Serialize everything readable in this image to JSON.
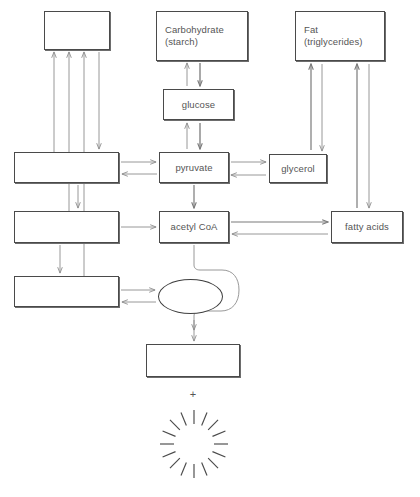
{
  "diagram": {
    "canvas": {
      "width": 420,
      "height": 497
    },
    "style": {
      "background": "#ffffff",
      "box_border_color": "#4a4a4a",
      "arrow_color": "#8d8d8d",
      "text_color": "#555555",
      "burst_color": "#4a4a4a"
    },
    "nodes": [
      {
        "id": "top-left-blank",
        "label": "",
        "label2": "",
        "shape": "rect",
        "align": "center",
        "x": 44,
        "y": 11,
        "w": 66,
        "h": 39
      },
      {
        "id": "carbohydrate",
        "label": "Carbohydrate",
        "label2": "(starch)",
        "shape": "rect",
        "align": "left",
        "x": 156,
        "y": 11,
        "w": 92,
        "h": 50
      },
      {
        "id": "fat",
        "label": "Fat",
        "label2": "(triglycerides)",
        "shape": "rect",
        "align": "left",
        "x": 295,
        "y": 11,
        "w": 90,
        "h": 50
      },
      {
        "id": "glucose",
        "label": "glucose",
        "label2": "",
        "shape": "rect",
        "align": "center",
        "x": 163,
        "y": 89,
        "w": 71,
        "h": 31
      },
      {
        "id": "mid-left-blank",
        "label": "",
        "label2": "",
        "shape": "rect",
        "align": "center",
        "x": 14,
        "y": 152,
        "w": 105,
        "h": 31
      },
      {
        "id": "pyruvate",
        "label": "pyruvate",
        "label2": "",
        "shape": "rect",
        "align": "center",
        "x": 159,
        "y": 152,
        "w": 70,
        "h": 31
      },
      {
        "id": "glycerol",
        "label": "glycerol",
        "label2": "",
        "shape": "rect",
        "align": "center",
        "x": 269,
        "y": 154,
        "w": 58,
        "h": 29
      },
      {
        "id": "lower-left-blank",
        "label": "",
        "label2": "",
        "shape": "rect",
        "align": "center",
        "x": 14,
        "y": 211,
        "w": 105,
        "h": 32
      },
      {
        "id": "acetyl-coa",
        "label": "acetyl CoA",
        "label2": "",
        "shape": "rect",
        "align": "center",
        "x": 159,
        "y": 211,
        "w": 70,
        "h": 32
      },
      {
        "id": "fatty-acids",
        "label": "fatty acids",
        "label2": "",
        "shape": "rect",
        "align": "center",
        "x": 331,
        "y": 211,
        "w": 72,
        "h": 32
      },
      {
        "id": "bottom-left-blank",
        "label": "",
        "label2": "",
        "shape": "rect",
        "align": "center",
        "x": 14,
        "y": 276,
        "w": 105,
        "h": 31
      },
      {
        "id": "cycle-ellipse",
        "label": "",
        "label2": "",
        "shape": "ellipse",
        "align": "center",
        "x": 158,
        "y": 279,
        "w": 65,
        "h": 35
      },
      {
        "id": "product-blank",
        "label": "",
        "label2": "",
        "shape": "rect",
        "align": "center",
        "x": 146,
        "y": 344,
        "w": 94,
        "h": 33
      }
    ],
    "plus_symbol": {
      "text": "+",
      "x": 184,
      "y": 389,
      "w": 18
    },
    "energy_burst": {
      "name": "energy-burst",
      "cx": 194,
      "cy": 444,
      "inner_radius": 20,
      "outer_radius": 34,
      "ray_count": 16
    }
  }
}
